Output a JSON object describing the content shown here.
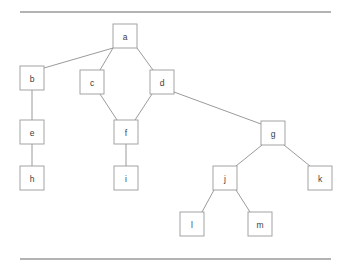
{
  "figure": {
    "background_color": "#ffffff",
    "node_fill": "#ffffff",
    "node_stroke": "#9a9a9a",
    "edge_stroke": "#8e8e8e",
    "label_color": "#3c3c3c",
    "rule_color": "#9a9a9a"
  },
  "rules": [
    {
      "name": "top-rule",
      "x1": 20,
      "y1": 12,
      "x2": 331,
      "y2": 12
    },
    {
      "name": "bottom-rule",
      "x1": 20,
      "y1": 259,
      "x2": 331,
      "y2": 259
    }
  ],
  "chart_data": {
    "type": "diagram",
    "layout": "node-link-tree",
    "title": "",
    "node_size": {
      "width": 24,
      "height": 24
    },
    "nodes": [
      {
        "id": "a",
        "label": "a",
        "x": 113,
        "y": 24
      },
      {
        "id": "b",
        "label": "b",
        "x": 20,
        "y": 66
      },
      {
        "id": "c",
        "label": "c",
        "x": 80,
        "y": 70
      },
      {
        "id": "d",
        "label": "d",
        "x": 150,
        "y": 70
      },
      {
        "id": "e",
        "label": "e",
        "x": 20,
        "y": 120
      },
      {
        "id": "f",
        "label": "f",
        "x": 114,
        "y": 120
      },
      {
        "id": "g",
        "label": "g",
        "x": 261,
        "y": 121
      },
      {
        "id": "h",
        "label": "h",
        "x": 20,
        "y": 166
      },
      {
        "id": "i",
        "label": "i",
        "x": 114,
        "y": 166
      },
      {
        "id": "j",
        "label": "j",
        "x": 213,
        "y": 166
      },
      {
        "id": "k",
        "label": "k",
        "x": 308,
        "y": 166
      },
      {
        "id": "l",
        "label": "l",
        "x": 180,
        "y": 212
      },
      {
        "id": "m",
        "label": "m",
        "x": 248,
        "y": 212
      }
    ],
    "edges": [
      {
        "source": "a",
        "target": "b",
        "x1": 113,
        "y1": 48,
        "x2": 44,
        "y2": 68
      },
      {
        "source": "a",
        "target": "c",
        "x1": 113,
        "y1": 48,
        "x2": 100,
        "y2": 70
      },
      {
        "source": "a",
        "target": "d",
        "x1": 137,
        "y1": 48,
        "x2": 153,
        "y2": 70
      },
      {
        "source": "b",
        "target": "e",
        "x1": 32,
        "y1": 90,
        "x2": 32,
        "y2": 120
      },
      {
        "source": "e",
        "target": "h",
        "x1": 32,
        "y1": 144,
        "x2": 32,
        "y2": 166
      },
      {
        "source": "c",
        "target": "f",
        "x1": 100,
        "y1": 94,
        "x2": 117,
        "y2": 120
      },
      {
        "source": "d",
        "target": "f",
        "x1": 152,
        "y1": 94,
        "x2": 135,
        "y2": 120
      },
      {
        "source": "f",
        "target": "i",
        "x1": 126,
        "y1": 144,
        "x2": 126,
        "y2": 166
      },
      {
        "source": "d",
        "target": "g",
        "x1": 174,
        "y1": 92,
        "x2": 261,
        "y2": 124
      },
      {
        "source": "g",
        "target": "j",
        "x1": 262,
        "y1": 145,
        "x2": 236,
        "y2": 166
      },
      {
        "source": "g",
        "target": "k",
        "x1": 284,
        "y1": 145,
        "x2": 310,
        "y2": 166
      },
      {
        "source": "j",
        "target": "l",
        "x1": 214,
        "y1": 190,
        "x2": 202,
        "y2": 212
      },
      {
        "source": "j",
        "target": "m",
        "x1": 236,
        "y1": 190,
        "x2": 250,
        "y2": 212
      }
    ]
  }
}
